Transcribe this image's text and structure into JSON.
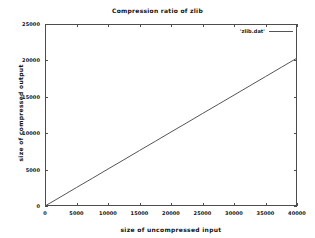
{
  "chart_data": {
    "type": "line",
    "title": "Compression ratio of zlib",
    "xlabel": "size of uncompressed input",
    "ylabel": "size of compressed output",
    "xlim": [
      0,
      40000
    ],
    "ylim": [
      0,
      25000
    ],
    "xticks": [
      0,
      5000,
      10000,
      15000,
      20000,
      25000,
      30000,
      35000,
      40000
    ],
    "yticks": [
      0,
      5000,
      10000,
      15000,
      20000,
      25000
    ],
    "xtick_labels": [
      "0",
      "5000",
      "10000",
      "15000",
      "20000",
      "25000",
      "30000",
      "35000",
      "40000"
    ],
    "ytick_labels": [
      "0",
      "5000",
      "10000",
      "15000",
      "20000",
      "25000"
    ],
    "grid": false,
    "legend_position": "top-right-inside",
    "series": [
      {
        "name": "'zlib.dat'",
        "style": "line",
        "color": "#555555",
        "x": [
          0,
          2500,
          5000,
          7500,
          10000,
          12500,
          15000,
          17500,
          20000,
          22500,
          25000,
          27500,
          30000,
          32500,
          35000,
          37500,
          40000
        ],
        "values": [
          0,
          1270,
          2540,
          3810,
          5080,
          6350,
          7620,
          8890,
          10160,
          11430,
          12700,
          13970,
          15240,
          16510,
          17780,
          19050,
          20320
        ]
      }
    ],
    "annotations": []
  },
  "legend": {
    "entries": [
      {
        "label": "'zlib.dat'",
        "icon": "line-sample-icon"
      }
    ]
  },
  "axes": {
    "x_axis_name": "x-axis",
    "y_axis_name": "y-axis"
  }
}
